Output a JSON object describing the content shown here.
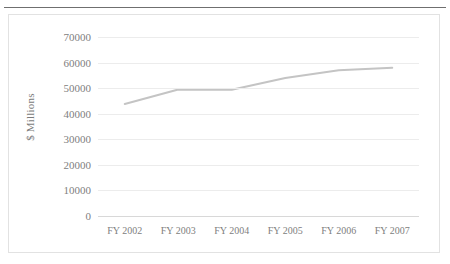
{
  "page": {
    "background_color": "#ffffff",
    "rule_color": "#6f6f6f"
  },
  "chart": {
    "frame_border_color": "#e2e2e2",
    "gridline_color": "#ececec",
    "axis_color": "#d8d8d8",
    "label_color": "#808080",
    "series_color": "#c4c4c4"
  },
  "chart_data": {
    "type": "line",
    "title": "",
    "xlabel": "",
    "ylabel": "$ Millions",
    "categories": [
      "FY 2002",
      "FY 2003",
      "FY 2004",
      "FY 2005",
      "FY 2006",
      "FY 2007"
    ],
    "values": [
      43800,
      49500,
      49400,
      54000,
      57000,
      58000
    ],
    "series": [
      {
        "name": "",
        "values": [
          43800,
          49500,
          49400,
          54000,
          57000,
          58000
        ]
      }
    ],
    "ylim": [
      0,
      70000
    ],
    "ytick_labels": [
      "0",
      "10000",
      "20000",
      "30000",
      "40000",
      "50000",
      "60000",
      "70000"
    ],
    "ytick_values": [
      0,
      10000,
      20000,
      30000,
      40000,
      50000,
      60000,
      70000
    ],
    "ytick_step": 10000,
    "grid": true,
    "grid_axis": "y",
    "legend": false,
    "legend_position": "none",
    "markers": false,
    "line_color": "#c4c4c4",
    "line_width": 2
  }
}
